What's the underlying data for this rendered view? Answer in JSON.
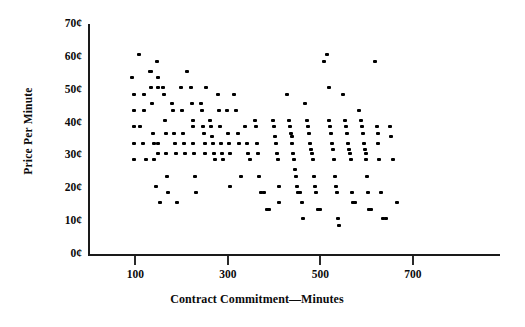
{
  "chart_data": {
    "type": "scatter",
    "title": "",
    "xlabel": "Contract Commitment—Minutes",
    "ylabel": "Price Per Minute",
    "xlim": [
      0,
      760
    ],
    "ylim": [
      0,
      70
    ],
    "xticks": [
      100,
      300,
      500,
      700
    ],
    "xtick_labels": [
      "100",
      "300",
      "500",
      "700"
    ],
    "yticks": [
      0,
      10,
      20,
      30,
      40,
      50,
      60,
      70
    ],
    "ytick_labels": [
      "0¢",
      "10¢",
      "20¢",
      "30¢",
      "40¢",
      "50¢",
      "60¢",
      "70¢"
    ],
    "grid": false,
    "legend": false,
    "marker": "square-dot",
    "marker_color": "#000000",
    "series": [
      {
        "name": "Contracts",
        "points": [
          [
            95,
            54
          ],
          [
            100,
            49
          ],
          [
            100,
            44
          ],
          [
            100,
            39
          ],
          [
            100,
            34
          ],
          [
            100,
            29
          ],
          [
            110,
            61
          ],
          [
            112,
            39
          ],
          [
            118,
            34
          ],
          [
            120,
            49
          ],
          [
            122,
            44
          ],
          [
            125,
            29
          ],
          [
            133,
            56
          ],
          [
            136,
            56
          ],
          [
            137,
            51
          ],
          [
            138,
            46
          ],
          [
            140,
            37
          ],
          [
            142,
            34
          ],
          [
            143,
            29
          ],
          [
            146,
            21
          ],
          [
            150,
            59
          ],
          [
            152,
            54
          ],
          [
            152,
            51
          ],
          [
            152,
            34
          ],
          [
            152,
            31
          ],
          [
            155,
            16
          ],
          [
            163,
            51
          ],
          [
            165,
            49
          ],
          [
            166,
            41
          ],
          [
            168,
            37
          ],
          [
            168,
            31
          ],
          [
            170,
            24
          ],
          [
            173,
            19
          ],
          [
            182,
            46
          ],
          [
            184,
            44
          ],
          [
            186,
            37
          ],
          [
            188,
            34
          ],
          [
            190,
            31
          ],
          [
            192,
            16
          ],
          [
            200,
            51
          ],
          [
            204,
            44
          ],
          [
            206,
            37
          ],
          [
            208,
            34
          ],
          [
            210,
            31
          ],
          [
            214,
            56
          ],
          [
            222,
            51
          ],
          [
            224,
            46
          ],
          [
            226,
            41
          ],
          [
            228,
            39
          ],
          [
            228,
            34
          ],
          [
            230,
            31
          ],
          [
            232,
            24
          ],
          [
            234,
            19
          ],
          [
            244,
            46
          ],
          [
            246,
            44
          ],
          [
            248,
            39
          ],
          [
            250,
            37
          ],
          [
            252,
            34
          ],
          [
            254,
            31
          ],
          [
            256,
            51
          ],
          [
            264,
            41
          ],
          [
            266,
            39
          ],
          [
            268,
            36
          ],
          [
            270,
            34
          ],
          [
            272,
            31
          ],
          [
            274,
            29
          ],
          [
            282,
            49
          ],
          [
            284,
            44
          ],
          [
            286,
            39
          ],
          [
            288,
            34
          ],
          [
            290,
            31
          ],
          [
            292,
            29
          ],
          [
            300,
            44
          ],
          [
            302,
            37
          ],
          [
            304,
            34
          ],
          [
            306,
            31
          ],
          [
            308,
            21
          ],
          [
            316,
            49
          ],
          [
            320,
            44
          ],
          [
            324,
            37
          ],
          [
            326,
            34
          ],
          [
            330,
            24
          ],
          [
            340,
            39
          ],
          [
            344,
            34
          ],
          [
            346,
            31
          ],
          [
            350,
            29
          ],
          [
            362,
            41
          ],
          [
            364,
            39
          ],
          [
            366,
            34
          ],
          [
            368,
            31
          ],
          [
            370,
            24
          ],
          [
            374,
            19
          ],
          [
            380,
            19
          ],
          [
            386,
            14
          ],
          [
            392,
            14
          ],
          [
            400,
            41
          ],
          [
            402,
            39
          ],
          [
            404,
            36
          ],
          [
            406,
            34
          ],
          [
            408,
            31
          ],
          [
            410,
            29
          ],
          [
            412,
            21
          ],
          [
            414,
            16
          ],
          [
            430,
            49
          ],
          [
            434,
            41
          ],
          [
            436,
            39
          ],
          [
            438,
            37
          ],
          [
            440,
            36
          ],
          [
            442,
            34
          ],
          [
            444,
            31
          ],
          [
            446,
            29
          ],
          [
            448,
            26
          ],
          [
            450,
            24
          ],
          [
            452,
            21
          ],
          [
            454,
            19
          ],
          [
            458,
            19
          ],
          [
            462,
            16
          ],
          [
            464,
            11
          ],
          [
            470,
            46
          ],
          [
            474,
            41
          ],
          [
            476,
            39
          ],
          [
            478,
            37
          ],
          [
            480,
            34
          ],
          [
            482,
            32
          ],
          [
            484,
            31
          ],
          [
            486,
            29
          ],
          [
            488,
            24
          ],
          [
            490,
            21
          ],
          [
            494,
            19
          ],
          [
            498,
            14
          ],
          [
            502,
            14
          ],
          [
            510,
            59
          ],
          [
            516,
            61
          ],
          [
            520,
            51
          ],
          [
            522,
            41
          ],
          [
            524,
            39
          ],
          [
            526,
            37
          ],
          [
            528,
            34
          ],
          [
            530,
            32
          ],
          [
            532,
            29
          ],
          [
            534,
            24
          ],
          [
            536,
            21
          ],
          [
            538,
            19
          ],
          [
            540,
            11
          ],
          [
            542,
            9
          ],
          [
            552,
            49
          ],
          [
            556,
            41
          ],
          [
            558,
            39
          ],
          [
            560,
            37
          ],
          [
            562,
            34
          ],
          [
            564,
            32
          ],
          [
            566,
            31
          ],
          [
            568,
            29
          ],
          [
            570,
            19
          ],
          [
            572,
            16
          ],
          [
            578,
            16
          ],
          [
            586,
            44
          ],
          [
            590,
            41
          ],
          [
            592,
            39
          ],
          [
            594,
            37
          ],
          [
            596,
            34
          ],
          [
            598,
            32
          ],
          [
            600,
            31
          ],
          [
            602,
            29
          ],
          [
            604,
            24
          ],
          [
            606,
            19
          ],
          [
            608,
            14
          ],
          [
            612,
            14
          ],
          [
            620,
            59
          ],
          [
            624,
            39
          ],
          [
            626,
            37
          ],
          [
            628,
            34
          ],
          [
            630,
            29
          ],
          [
            634,
            19
          ],
          [
            638,
            11
          ],
          [
            644,
            11
          ],
          [
            652,
            39
          ],
          [
            656,
            36
          ],
          [
            660,
            29
          ],
          [
            668,
            16
          ]
        ]
      }
    ]
  },
  "axis_geometry": {
    "x_origin_px": 88,
    "x_scale_px_per_unit": 0.4625,
    "x_value_at_origin": 0,
    "y_zero_px": 255,
    "y_scale_px_per_cent": 3.2857
  }
}
